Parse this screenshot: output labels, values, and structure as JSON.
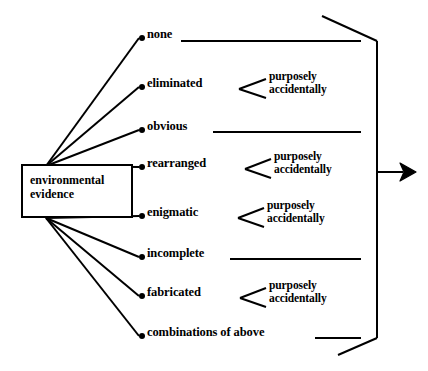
{
  "diagram": {
    "source": {
      "label_line1": "environmental",
      "label_line2": "evidence",
      "shape": "rectangle"
    },
    "sub_options": {
      "purposely": "purposely",
      "accidentally": "accidentally"
    },
    "branches": [
      {
        "id": "none",
        "label": "none",
        "has_fork": false,
        "has_rule": true
      },
      {
        "id": "eliminated",
        "label": "eliminated",
        "has_fork": true,
        "has_rule": false
      },
      {
        "id": "obvious",
        "label": "obvious",
        "has_fork": false,
        "has_rule": true
      },
      {
        "id": "rearranged",
        "label": "rearranged",
        "has_fork": true,
        "has_rule": false
      },
      {
        "id": "enigmatic",
        "label": "enigmatic",
        "has_fork": true,
        "has_rule": false
      },
      {
        "id": "incomplete",
        "label": "incomplete",
        "has_fork": false,
        "has_rule": true
      },
      {
        "id": "fabricated",
        "label": "fabricated",
        "has_fork": true,
        "has_rule": false
      },
      {
        "id": "combinations",
        "label": "combinations of above",
        "has_fork": false,
        "has_rule": true
      }
    ],
    "output": {
      "arrow_direction": "right",
      "brace_side": "right"
    },
    "colors": {
      "ink": "#000000",
      "background": "#ffffff"
    }
  }
}
